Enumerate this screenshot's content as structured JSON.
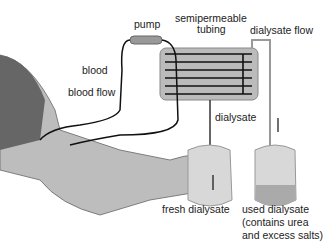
{
  "diagram": {
    "labels": {
      "pump": "pump",
      "tubing1": "semipermeable",
      "tubing2": "tubing",
      "dialysate_flow": "dialysate flow",
      "blood": "blood",
      "blood_flow": "blood flow",
      "dialysate": "dialysate",
      "fresh": "fresh dialysate",
      "used1": "used dialysate",
      "used2": "(contains urea",
      "used3": "and excess salts)"
    }
  }
}
